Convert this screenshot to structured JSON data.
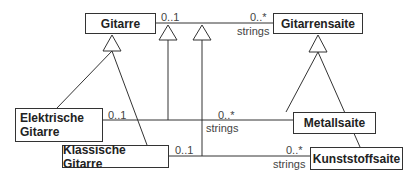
{
  "diagram": {
    "type": "UML class diagram",
    "classes": {
      "gitarre": "Gitarre",
      "gitarrensaite": "Gitarrensaite",
      "elektrische_gitarre": "Elektrische Gitarre",
      "elektrische_line1": "Elektrische",
      "elektrische_line2": "Gitarre",
      "metallsaite": "Metallsaite",
      "klassische_gitarre": "Klassische Gitarre",
      "kunststoffsaite": "Kunststoffsaite"
    },
    "associations": [
      {
        "from": "Gitarre",
        "to": "Gitarrensaite",
        "from_mult": "0..1",
        "to_mult": "0..*",
        "role": "strings"
      },
      {
        "from": "Elektrische Gitarre",
        "to": "Metallsaite",
        "from_mult": "0..1",
        "to_mult": "0..*",
        "role": "strings"
      },
      {
        "from": "Klassische Gitarre",
        "to": "Kunststoffsaite",
        "from_mult": "0..1",
        "to_mult": "0..*",
        "role": "strings"
      }
    ],
    "generalizations": [
      {
        "child": "Elektrische Gitarre",
        "parent": "Gitarre"
      },
      {
        "child": "Klassische Gitarre",
        "parent": "Gitarre"
      },
      {
        "child": "Metallsaite",
        "parent": "Gitarrensaite"
      },
      {
        "child": "Kunststoffsaite",
        "parent": "Gitarrensaite"
      },
      {
        "child": "Elektrische Gitarre–Metallsaite association",
        "parent": "Gitarre–Gitarrensaite association"
      },
      {
        "child": "Klassische Gitarre–Kunststoffsaite association",
        "parent": "Gitarre–Gitarrensaite association"
      }
    ],
    "labels": {
      "mult_01": "0..1",
      "mult_0n": "0..*",
      "role": "strings"
    }
  }
}
